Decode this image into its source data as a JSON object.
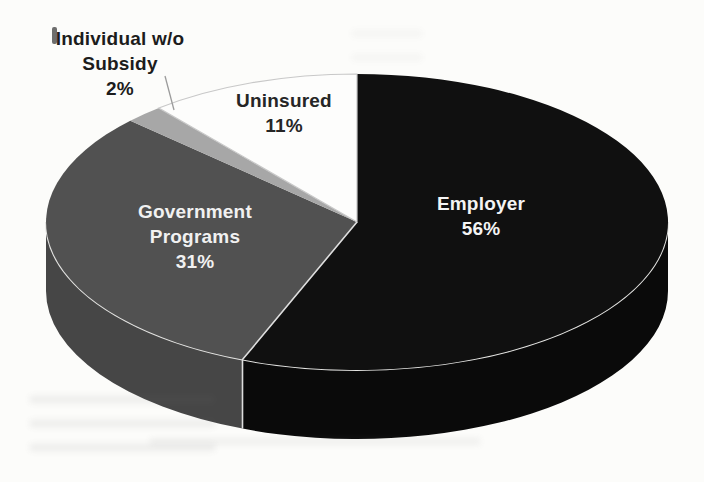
{
  "chart_data": {
    "type": "pie",
    "style": "3d",
    "direction": "clockwise",
    "start_angle": "12-o-clock",
    "legend_position": "none (labels on/beside slices)",
    "background_color": "#fcfcfa",
    "slices": [
      {
        "id": "employer",
        "label": "Employer",
        "value": 56,
        "pct_text": "56%",
        "color": "#101010",
        "side_color": "#0a0a0a",
        "text_color": "#f4f4f4",
        "label_placement": "inside"
      },
      {
        "id": "government-programs",
        "label": "Government Programs",
        "value": 31,
        "pct_text": "31%",
        "color": "#515151",
        "side_color": "#464646",
        "text_color": "#f1f1f1",
        "label_placement": "inside"
      },
      {
        "id": "individual-wo-subsidy",
        "label": "Individual w/o Subsidy",
        "value": 2,
        "pct_text": "2%",
        "color": "#a7a7a7",
        "text_color": "#1c1c1c",
        "label_placement": "outside-callout"
      },
      {
        "id": "uninsured",
        "label": "Uninsured",
        "value": 11,
        "pct_text": "11%",
        "color": "#fdfdfc",
        "outline": "#c8c8c8",
        "text_color": "#262626",
        "label_placement": "on-slice"
      }
    ],
    "accents": {
      "rim_highlight_color": "#e4e4e2",
      "slice_divider_color": "#dedede",
      "callout_line_color": "#9b9b9b"
    }
  }
}
